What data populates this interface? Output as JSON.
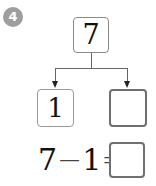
{
  "problem": {
    "number": "4",
    "badge_color": "#9e9e9e"
  },
  "number_bond": {
    "whole": "7",
    "part_left": "1",
    "part_right": ""
  },
  "equation": {
    "minuend": "7",
    "operator": "−",
    "subtrahend": "1",
    "equals": "=",
    "answer": ""
  }
}
